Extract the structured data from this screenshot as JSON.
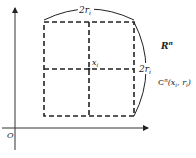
{
  "diagram": {
    "origin_label": "O",
    "center_label": "x",
    "center_sub": "i",
    "top_measure": {
      "main": "2r",
      "sub": "i"
    },
    "right_measure": {
      "main": "2r",
      "sub": "i"
    },
    "space_label": {
      "main": "R",
      "sup": "n"
    },
    "cube_label": {
      "main": "C",
      "sup": "n",
      "args": "(x",
      "arg1_sub": "i",
      "sep": ", r",
      "arg2_sub": "i",
      "close": ")"
    },
    "colors": {
      "stroke": "#222222",
      "background": "#ffffff"
    }
  }
}
